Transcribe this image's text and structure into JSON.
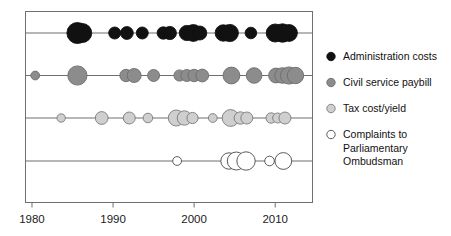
{
  "chart_data": {
    "type": "scatter",
    "title": "",
    "subtitle": "",
    "xlabel": "",
    "ylabel": "",
    "xlim": [
      1979.2,
      2014.6
    ],
    "xticks": [
      1980,
      1990,
      2000,
      2010
    ],
    "xtick_labels": [
      "1980",
      "1990",
      "2000",
      "2010"
    ],
    "grid": false,
    "legend_position": "right",
    "note": "Bubble/dot timeline: each row is one series; marker area encodes magnitude of the measure for that year.",
    "series": [
      {
        "name": "Administration costs",
        "color": "#111111",
        "edge_color": "#111111",
        "row": 0,
        "points": [
          {
            "x": 1985.6,
            "r": 10.5
          },
          {
            "x": 1986.2,
            "r": 9.5
          },
          {
            "x": 1990.2,
            "r": 6.0
          },
          {
            "x": 1991.7,
            "r": 6.4
          },
          {
            "x": 1993.6,
            "r": 6.0
          },
          {
            "x": 1996.2,
            "r": 6.2
          },
          {
            "x": 1997.0,
            "r": 6.6
          },
          {
            "x": 1999.1,
            "r": 7.6
          },
          {
            "x": 1999.9,
            "r": 8.4
          },
          {
            "x": 2000.7,
            "r": 7.0
          },
          {
            "x": 2003.6,
            "r": 8.2
          },
          {
            "x": 2004.4,
            "r": 8.6
          },
          {
            "x": 2007.0,
            "r": 5.8
          },
          {
            "x": 2010.0,
            "r": 9.0
          },
          {
            "x": 2010.9,
            "r": 9.2
          },
          {
            "x": 2011.7,
            "r": 8.4
          }
        ]
      },
      {
        "name": "Civil service paybill",
        "color": "#8c8c8c",
        "edge_color": "#6d6d6d",
        "row": 1,
        "points": [
          {
            "x": 1980.4,
            "r": 4.4
          },
          {
            "x": 1985.6,
            "r": 9.6
          },
          {
            "x": 1991.6,
            "r": 6.2
          },
          {
            "x": 1992.6,
            "r": 7.0
          },
          {
            "x": 1995.0,
            "r": 6.0
          },
          {
            "x": 1998.2,
            "r": 5.6
          },
          {
            "x": 1999.1,
            "r": 6.0
          },
          {
            "x": 2000.0,
            "r": 6.2
          },
          {
            "x": 2001.0,
            "r": 6.4
          },
          {
            "x": 2004.6,
            "r": 8.4
          },
          {
            "x": 2007.4,
            "r": 7.8
          },
          {
            "x": 2010.1,
            "r": 7.4
          },
          {
            "x": 2010.9,
            "r": 7.8
          },
          {
            "x": 2011.7,
            "r": 8.6
          },
          {
            "x": 2012.5,
            "r": 8.2
          }
        ]
      },
      {
        "name": "Tax cost/yield",
        "color": "#cfcfcf",
        "edge_color": "#7a7a7a",
        "row": 2,
        "points": [
          {
            "x": 1983.6,
            "r": 4.2
          },
          {
            "x": 1988.6,
            "r": 6.4
          },
          {
            "x": 1992.0,
            "r": 6.0
          },
          {
            "x": 1994.3,
            "r": 4.8
          },
          {
            "x": 1997.8,
            "r": 8.0
          },
          {
            "x": 1998.8,
            "r": 7.2
          },
          {
            "x": 1999.8,
            "r": 5.6
          },
          {
            "x": 2002.3,
            "r": 4.4
          },
          {
            "x": 2004.5,
            "r": 8.4
          },
          {
            "x": 2005.7,
            "r": 6.2
          },
          {
            "x": 2006.5,
            "r": 6.0
          },
          {
            "x": 2009.5,
            "r": 5.2
          },
          {
            "x": 2010.3,
            "r": 5.0
          },
          {
            "x": 2011.2,
            "r": 6.0
          }
        ]
      },
      {
        "name": "Complaints to Parliamentary Ombudsman",
        "color": "#ffffff",
        "edge_color": "#5a5a5a",
        "row": 3,
        "points": [
          {
            "x": 1997.9,
            "r": 4.4
          },
          {
            "x": 2004.3,
            "r": 8.2
          },
          {
            "x": 2005.2,
            "r": 9.0
          },
          {
            "x": 2006.4,
            "r": 9.2
          },
          {
            "x": 2009.3,
            "r": 4.8
          },
          {
            "x": 2011.0,
            "r": 8.4
          }
        ]
      }
    ],
    "legend_entries": [
      {
        "label": "Administration costs",
        "color": "#111111",
        "edge_color": "#111111",
        "lines": [
          "Administration costs"
        ]
      },
      {
        "label": "Civil service paybill",
        "color": "#8c8c8c",
        "edge_color": "#6d6d6d",
        "lines": [
          "Civil service paybill"
        ]
      },
      {
        "label": "Tax cost/yield",
        "color": "#cfcfcf",
        "edge_color": "#7a7a7a",
        "lines": [
          "Tax cost/yield"
        ]
      },
      {
        "label": "Complaints to Parliamentary Ombudsman",
        "color": "#ffffff",
        "edge_color": "#5a5a5a",
        "lines": [
          "Complaints to",
          "Parliamentary",
          "Ombudsman"
        ]
      }
    ]
  },
  "axis": {
    "tick_1980": "1980",
    "tick_1990": "1990",
    "tick_2000": "2000",
    "tick_2010": "2010"
  },
  "legend": {
    "entry_1_line_1": "Administration costs",
    "entry_2_line_1": "Civil service paybill",
    "entry_3_line_1": "Tax cost/yield",
    "entry_4_line_1": "Complaints to",
    "entry_4_line_2": "Parliamentary",
    "entry_4_line_3": "Ombudsman"
  },
  "colors": {
    "series_1": "#111111",
    "series_2": "#8c8c8c",
    "series_3": "#cfcfcf",
    "series_4": "#ffffff",
    "frame": "#6f6f6f",
    "row_line": "#6f6f6f",
    "background": "#ffffff"
  }
}
